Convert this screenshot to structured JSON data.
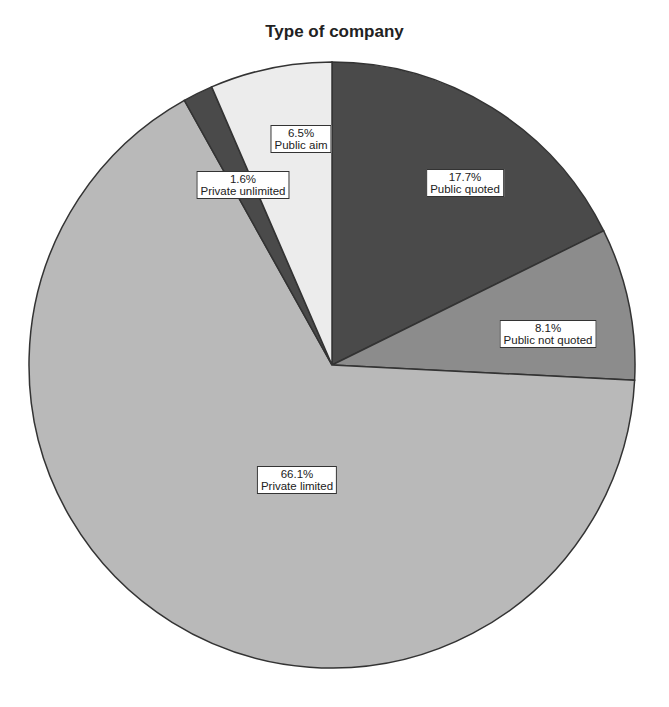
{
  "chart_data": {
    "type": "pie",
    "title": "Type of company",
    "slices": [
      {
        "label": "Public quoted",
        "value": 17.7,
        "pct_text": "17.7%",
        "color": "#4a4a4a"
      },
      {
        "label": "Public not quoted",
        "value": 8.1,
        "pct_text": "8.1%",
        "color": "#8c8c8c"
      },
      {
        "label": "Private limited",
        "value": 66.1,
        "pct_text": "66.1%",
        "color": "#b9b9b9"
      },
      {
        "label": "Private unlimited",
        "value": 1.6,
        "pct_text": "1.6%",
        "color": "#4a4a4a"
      },
      {
        "label": "Public aim",
        "value": 6.5,
        "pct_text": "6.5%",
        "color": "#ececec"
      }
    ],
    "start_angle_deg": 0,
    "direction": "clockwise",
    "legend": "none"
  }
}
